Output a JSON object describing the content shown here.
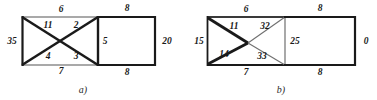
{
  "figure": {
    "background_color": "#ffffff",
    "line_color_thick": "#1a1a1a",
    "line_color_thin": "#8c8c8c",
    "text_color": "#1a1a1a"
  },
  "diagram_a": {
    "caption": "a)",
    "labels": {
      "top_left_edge": "6",
      "upper_left_diagonal": "11",
      "upper_right_diagonal": "2",
      "left_edge": "35",
      "lower_left_diagonal": "4",
      "lower_right_diagonal": "3",
      "bottom_left_edge": "7",
      "middle_divider": "5",
      "top_right_edge": "8",
      "bottom_right_edge": "8",
      "right_edge": "20"
    }
  },
  "diagram_b": {
    "caption": "b)",
    "labels": {
      "top_left_edge": "6",
      "upper_left_diagonal": "11",
      "upper_right_diagonal": "32",
      "left_edge": "15",
      "lower_left_diagonal": "14",
      "lower_right_diagonal": "33",
      "bottom_left_edge": "7",
      "middle_divider": "25",
      "top_right_edge": "8",
      "bottom_right_edge": "8",
      "right_edge": "0"
    }
  }
}
